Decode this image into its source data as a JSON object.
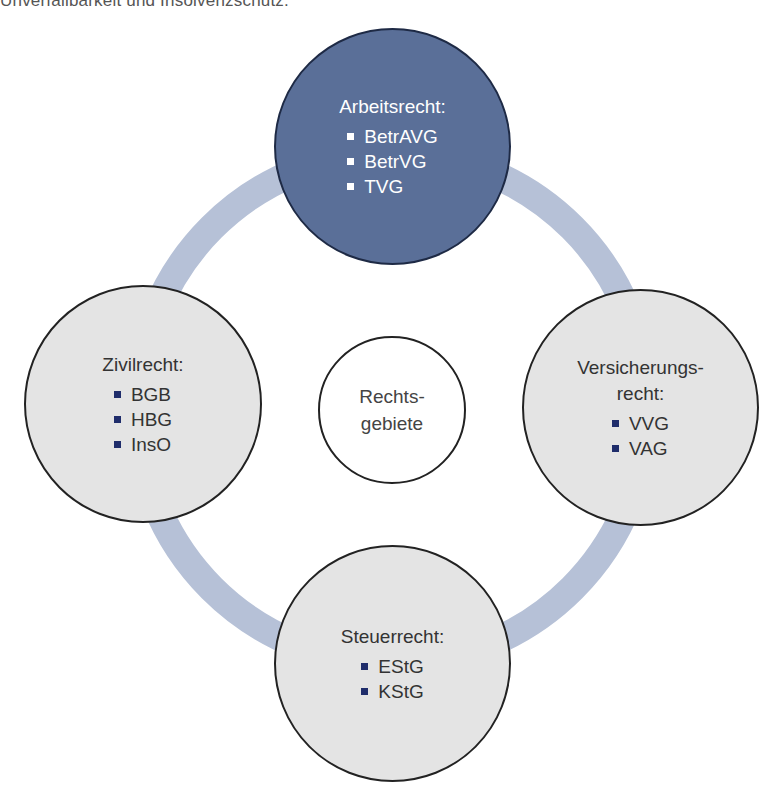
{
  "header": {
    "cutoff_text": "Unverfallbarkeit und Insolvenzschutz."
  },
  "colors": {
    "ring": "#b6c1d7",
    "accent_dark": "#5a6f98",
    "node_light": "#e4e4e4",
    "bullet_dark": "#1f2d6b"
  },
  "center": {
    "line1": "Rechts-",
    "line2": "gebiete"
  },
  "nodes": {
    "top": {
      "title": "Arbeitsrecht:",
      "items": [
        "BetrAVG",
        "BetrVG",
        "TVG"
      ]
    },
    "left": {
      "title": "Zivilrecht:",
      "items": [
        "BGB",
        "HBG",
        "InsO"
      ]
    },
    "right": {
      "title_line1": "Versicherungs-",
      "title_line2": "recht:",
      "items": [
        "VVG",
        "VAG"
      ]
    },
    "bottom": {
      "title": "Steuerrecht:",
      "items": [
        "EStG",
        "KStG"
      ]
    }
  }
}
